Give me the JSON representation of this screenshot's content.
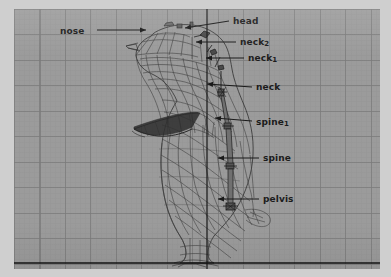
{
  "viewport": {
    "name": "3d-modeling-viewport",
    "background_color": "#9b9b9b",
    "frame_color": "#cfcfcf",
    "grid_minor_color": "#969696",
    "grid_major_color": "#7a7a7a",
    "axis_color": "#1a1a1a",
    "wire_color": "#3a3a3a",
    "vertical_axis_x": 207,
    "ground_axis_y": 263
  },
  "model": {
    "name": "penguin-wireframe",
    "facing": "left",
    "description": "Wireframe penguin mesh with skeleton bone chain"
  },
  "annotations": [
    {
      "id": "nose",
      "label": "nose",
      "label_x": 60,
      "label_y": 26,
      "arrow_from_x": 97,
      "arrow_from_y": 30,
      "arrow_to_x": 146,
      "arrow_to_y": 30,
      "direction": "right"
    },
    {
      "id": "head",
      "label": "head",
      "label_x": 233,
      "label_y": 16,
      "arrow_from_x": 229,
      "arrow_from_y": 21,
      "arrow_to_x": 185,
      "arrow_to_y": 28,
      "direction": "left"
    },
    {
      "id": "neck2",
      "label": "neck",
      "sub": "2",
      "label_x": 240,
      "label_y": 37,
      "arrow_from_x": 236,
      "arrow_from_y": 42,
      "arrow_to_x": 196,
      "arrow_to_y": 42,
      "direction": "left"
    },
    {
      "id": "neck1",
      "label": "neck",
      "sub": "1",
      "label_x": 248,
      "label_y": 53,
      "arrow_from_x": 244,
      "arrow_from_y": 58,
      "arrow_to_x": 206,
      "arrow_to_y": 58,
      "direction": "left"
    },
    {
      "id": "neck",
      "label": "neck",
      "label_x": 256,
      "label_y": 82,
      "arrow_from_x": 252,
      "arrow_from_y": 87,
      "arrow_to_x": 207,
      "arrow_to_y": 84,
      "direction": "left"
    },
    {
      "id": "spine1",
      "label": "spine",
      "sub": "1",
      "label_x": 256,
      "label_y": 117,
      "arrow_from_x": 252,
      "arrow_from_y": 121,
      "arrow_to_x": 215,
      "arrow_to_y": 118,
      "direction": "left"
    },
    {
      "id": "spine",
      "label": "spine",
      "label_x": 263,
      "label_y": 153,
      "arrow_from_x": 259,
      "arrow_from_y": 158,
      "arrow_to_x": 218,
      "arrow_to_y": 158,
      "direction": "left"
    },
    {
      "id": "pelvis",
      "label": "pelvis",
      "label_x": 263,
      "label_y": 194,
      "arrow_from_x": 259,
      "arrow_from_y": 199,
      "arrow_to_x": 218,
      "arrow_to_y": 199,
      "direction": "left"
    }
  ]
}
